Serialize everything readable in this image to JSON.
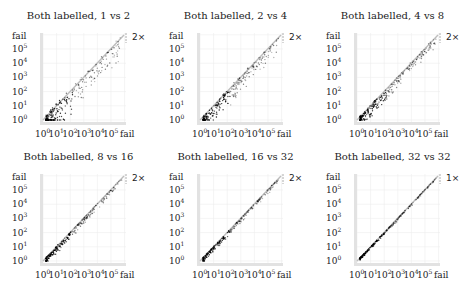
{
  "figure": {
    "panels": [
      {
        "title": "Both labelled, 1 vs 2",
        "ratio_label": "2×",
        "scatter_spread": 1.0
      },
      {
        "title": "Both labelled, 2 vs 4",
        "ratio_label": "2×",
        "scatter_spread": 0.7
      },
      {
        "title": "Both labelled, 4 vs 8",
        "ratio_label": "2×",
        "scatter_spread": 0.45
      },
      {
        "title": "Both labelled, 8 vs 16",
        "ratio_label": "2×",
        "scatter_spread": 0.3
      },
      {
        "title": "Both labelled, 16 vs 32",
        "ratio_label": "2×",
        "scatter_spread": 0.2
      },
      {
        "title": "Both labelled, 32 vs 32",
        "ratio_label": "1×",
        "scatter_spread": 0.1
      }
    ],
    "axis": {
      "y_ticks": [
        "10",
        "10",
        "10",
        "10",
        "10",
        "10"
      ],
      "y_exps": [
        "0",
        "1",
        "2",
        "3",
        "4",
        "5"
      ],
      "x_ticks": [
        "10",
        "10",
        "10",
        "10",
        "10",
        "10"
      ],
      "x_exps": [
        "0",
        "1",
        "2",
        "3",
        "4",
        "5"
      ],
      "fail_label": "fail"
    }
  },
  "chart_data": [
    {
      "type": "scatter",
      "title": "Both labelled, 1 vs 2",
      "xscale": "log",
      "yscale": "log",
      "x_ticks": [
        "10^0",
        "10^1",
        "10^2",
        "10^3",
        "10^4",
        "10^5",
        "fail"
      ],
      "y_ticks": [
        "10^0",
        "10^1",
        "10^2",
        "10^3",
        "10^4",
        "10^5",
        "fail"
      ],
      "annotation": "2×",
      "description": "Points cluster near diagonal, dense black cloud around 10^1-10^2, wide scatter below diagonal",
      "grid": true
    },
    {
      "type": "scatter",
      "title": "Both labelled, 2 vs 4",
      "xscale": "log",
      "yscale": "log",
      "x_ticks": [
        "10^0",
        "10^1",
        "10^2",
        "10^3",
        "10^4",
        "10^5",
        "fail"
      ],
      "y_ticks": [
        "10^0",
        "10^1",
        "10^2",
        "10^3",
        "10^4",
        "10^5",
        "fail"
      ],
      "annotation": "2×",
      "description": "Points along diagonal with moderate spread below",
      "grid": true
    },
    {
      "type": "scatter",
      "title": "Both labelled, 4 vs 8",
      "xscale": "log",
      "yscale": "log",
      "x_ticks": [
        "10^0",
        "10^1",
        "10^2",
        "10^3",
        "10^4",
        "10^5",
        "fail"
      ],
      "y_ticks": [
        "10^0",
        "10^1",
        "10^2",
        "10^3",
        "10^4",
        "10^5",
        "fail"
      ],
      "annotation": "2×",
      "description": "Tight band along diagonal",
      "grid": true
    },
    {
      "type": "scatter",
      "title": "Both labelled, 8 vs 16",
      "xscale": "log",
      "yscale": "log",
      "x_ticks": [
        "10^0",
        "10^1",
        "10^2",
        "10^3",
        "10^4",
        "10^5",
        "fail"
      ],
      "y_ticks": [
        "10^0",
        "10^1",
        "10^2",
        "10^3",
        "10^4",
        "10^5",
        "fail"
      ],
      "annotation": "2×",
      "description": "Tight band along diagonal",
      "grid": true
    },
    {
      "type": "scatter",
      "title": "Both labelled, 16 vs 32",
      "xscale": "log",
      "yscale": "log",
      "x_ticks": [
        "10^0",
        "10^1",
        "10^2",
        "10^3",
        "10^4",
        "10^5",
        "fail"
      ],
      "y_ticks": [
        "10^0",
        "10^1",
        "10^2",
        "10^3",
        "10^4",
        "10^5",
        "fail"
      ],
      "annotation": "2×",
      "description": "Very tight band along diagonal",
      "grid": true
    },
    {
      "type": "scatter",
      "title": "Both labelled, 32 vs 32",
      "xscale": "log",
      "yscale": "log",
      "x_ticks": [
        "10^0",
        "10^1",
        "10^2",
        "10^3",
        "10^4",
        "10^5",
        "fail"
      ],
      "y_ticks": [
        "10^0",
        "10^1",
        "10^2",
        "10^3",
        "10^4",
        "10^5",
        "fail"
      ],
      "annotation": "1×",
      "description": "Points lie on diagonal",
      "grid": true
    }
  ]
}
